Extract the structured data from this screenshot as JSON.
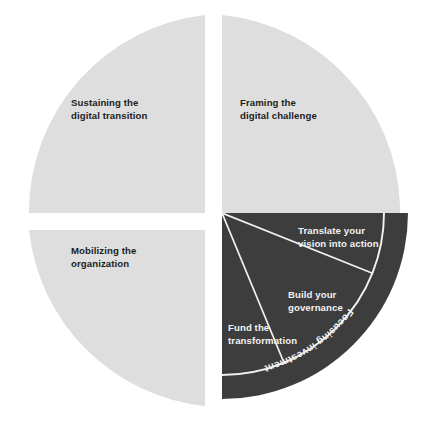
{
  "diagram": {
    "type": "quartered-circle-framework",
    "colors": {
      "light_segment": "#dedede",
      "dark_segment": "#3d3d3d",
      "light_text": "#1d1d1d",
      "dark_text": "#f2f2f2",
      "divider": "#f2f2f2",
      "background": "#ffffff"
    },
    "quadrants": [
      {
        "id": "sustaining",
        "position": "top-left",
        "tone": "light",
        "label_line1": "Sustaining the",
        "label_line2": "digital transition"
      },
      {
        "id": "framing",
        "position": "top-right",
        "tone": "light",
        "label_line1": "Framing the",
        "label_line2": "digital challenge"
      },
      {
        "id": "mobilizing",
        "position": "bottom-left",
        "tone": "light",
        "label_line1": "Mobilizing the",
        "label_line2": "organization"
      },
      {
        "id": "focusing",
        "position": "bottom-right",
        "tone": "dark",
        "arc_label": "Focusing investment",
        "wedges": [
          {
            "id": "translate-vision",
            "label_line1": "Translate your",
            "label_line2": "vision into action"
          },
          {
            "id": "build-governance",
            "label_line1": "Build your",
            "label_line2": "governance"
          },
          {
            "id": "fund-transformation",
            "label_line1": "Fund the",
            "label_line2": "transformation"
          }
        ]
      }
    ]
  }
}
